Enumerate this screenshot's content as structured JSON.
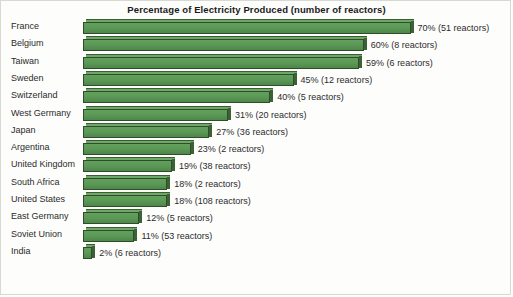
{
  "chart_data": {
    "type": "bar",
    "orientation": "horizontal",
    "title": "Percentage of Electricity Produced (number of reactors)",
    "xlabel": "",
    "ylabel": "",
    "xlim": [
      0,
      70
    ],
    "grid": false,
    "legend": false,
    "style": "3d-horizontal-bar",
    "colors": {
      "bar_face": "#5a9655",
      "bar_shadow": "#3b6134",
      "bar_highlight": "#6ea866",
      "bar_outline": "#2f4d2a",
      "background": "#fdfdfc",
      "frame": "#d9d9d4",
      "text": "#2b2b2b"
    },
    "categories": [
      "France",
      "Belgium",
      "Taiwan",
      "Sweden",
      "Switzerland",
      "West Germany",
      "Japan",
      "Argentina",
      "United Kingdom",
      "South Africa",
      "United States",
      "East Germany",
      "Soviet Union",
      "India"
    ],
    "values": [
      70,
      60,
      59,
      45,
      40,
      31,
      27,
      23,
      19,
      18,
      18,
      12,
      11,
      2
    ],
    "reactors": [
      51,
      8,
      6,
      12,
      5,
      20,
      36,
      2,
      38,
      2,
      108,
      5,
      53,
      6
    ],
    "value_labels": [
      "70% (51 reactors)",
      "60% (8 reactors)",
      "59% (6 reactors)",
      "45% (12 reactors)",
      "40% (5 reactors)",
      "31% (20 reactors)",
      "27% (36 reactors)",
      "23% (2 reactors)",
      "19% (38 reactors)",
      "18% (2 reactors)",
      "18% (108 reactors)",
      "12% (5 reactors)",
      "11% (53 reactors)",
      "2% (6 reactors)"
    ]
  }
}
